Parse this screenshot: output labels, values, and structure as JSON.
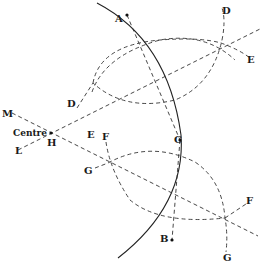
{
  "figure": {
    "labels": {
      "A": "A",
      "B": "B",
      "C": "C",
      "D_top": "D",
      "E_top": "E",
      "D_left": "D",
      "E_left": "E",
      "F_left": "F",
      "G_left": "G",
      "F_right": "F",
      "G_bottom": "G",
      "M": "M",
      "L": "L",
      "H": "H",
      "centre": "Centre"
    },
    "colors": {
      "line": "#222222",
      "background": "#ffffff"
    }
  }
}
